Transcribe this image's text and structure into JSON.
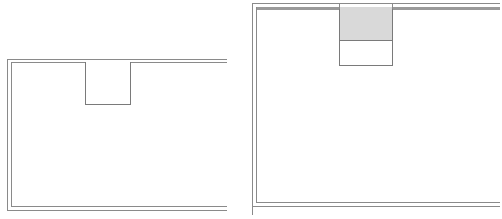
{
  "figures": [
    {
      "name": "left-room-outline",
      "description": "Double-line wall outline with an empty rectangular niche on the top wall",
      "niche": {
        "filled": false
      }
    },
    {
      "name": "right-room-outline",
      "description": "Double-line wall outline with a rectangular niche on the top wall, upper portion shaded gray",
      "niche": {
        "filled": true,
        "fill_color": "#d9d9d9"
      }
    }
  ],
  "colors": {
    "line": "#8a8a8a",
    "fill": "#d9d9d9",
    "background": "#ffffff"
  }
}
